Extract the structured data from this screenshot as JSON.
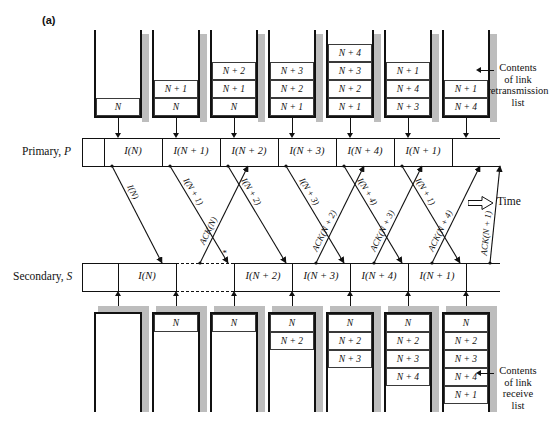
{
  "figure": {
    "tag": "(a)",
    "time_legend": "Time",
    "time_arrow_icon": "right-arrow-outline-icon"
  },
  "axes": {
    "primary": {
      "name": "Primary,",
      "symbol": "P"
    },
    "secondary": {
      "name": "Secondary,",
      "symbol": "S"
    }
  },
  "callouts": {
    "retransmission": {
      "lines": [
        "Contents",
        "of link",
        "retransmission",
        "list"
      ],
      "arrow_icon": "left-arrow-icon"
    },
    "receive": {
      "lines": [
        "Contents",
        "of link",
        "receive",
        "list"
      ],
      "arrow_icon": "left-arrow-icon"
    }
  },
  "primary_timeline": {
    "frames": [
      "I(N)",
      "I(N + 1)",
      "I(N + 2)",
      "I(N + 3)",
      "I(N + 4)",
      "I(N + 1)"
    ]
  },
  "secondary_timeline": {
    "frames": [
      {
        "label": "I(N)",
        "lost": false
      },
      {
        "label": "",
        "lost": true
      },
      {
        "label": "I(N + 2)",
        "lost": false
      },
      {
        "label": "I(N + 3)",
        "lost": false
      },
      {
        "label": "I(N + 4)",
        "lost": false
      },
      {
        "label": "I(N + 1)",
        "lost": false
      }
    ],
    "lost_marker": "*"
  },
  "retransmission_lists": [
    {
      "entries": [
        "N"
      ]
    },
    {
      "entries": [
        "N",
        "N + 1"
      ]
    },
    {
      "entries": [
        "N",
        "N + 1",
        "N + 2"
      ]
    },
    {
      "entries": [
        "N + 1",
        "N + 2",
        "N + 3"
      ]
    },
    {
      "entries": [
        "N + 1",
        "N + 2",
        "N + 3",
        "N + 4"
      ]
    },
    {
      "entries": [
        "N + 3",
        "N + 4",
        "N + 1"
      ]
    },
    {
      "entries": [
        "N + 4",
        "N + 1"
      ]
    }
  ],
  "receive_lists": [
    {
      "entries": []
    },
    {
      "entries": [
        "N"
      ]
    },
    {
      "entries": [
        "N"
      ]
    },
    {
      "entries": [
        "N",
        "N + 2"
      ]
    },
    {
      "entries": [
        "N",
        "N + 2",
        "N + 3"
      ]
    },
    {
      "entries": [
        "N",
        "N + 2",
        "N + 3",
        "N + 4"
      ]
    },
    {
      "entries": [
        "N",
        "N + 2",
        "N + 3",
        "N + 4",
        "N + 1"
      ]
    }
  ],
  "downlink_messages": [
    "I(N)",
    "I(N + 1)",
    "I(N + 2)",
    "I(N + 3)",
    "I(N + 4)",
    "I(N + 1)"
  ],
  "uplink_messages": [
    "ACK(N)",
    "ACK(N + 2)",
    "ACK(N + 3)",
    "ACK(N + 4)",
    "ACK(N + 1)"
  ],
  "colors": {
    "ink": "#111111",
    "shadow": "#bdbdbd",
    "paper": "#ffffff"
  }
}
